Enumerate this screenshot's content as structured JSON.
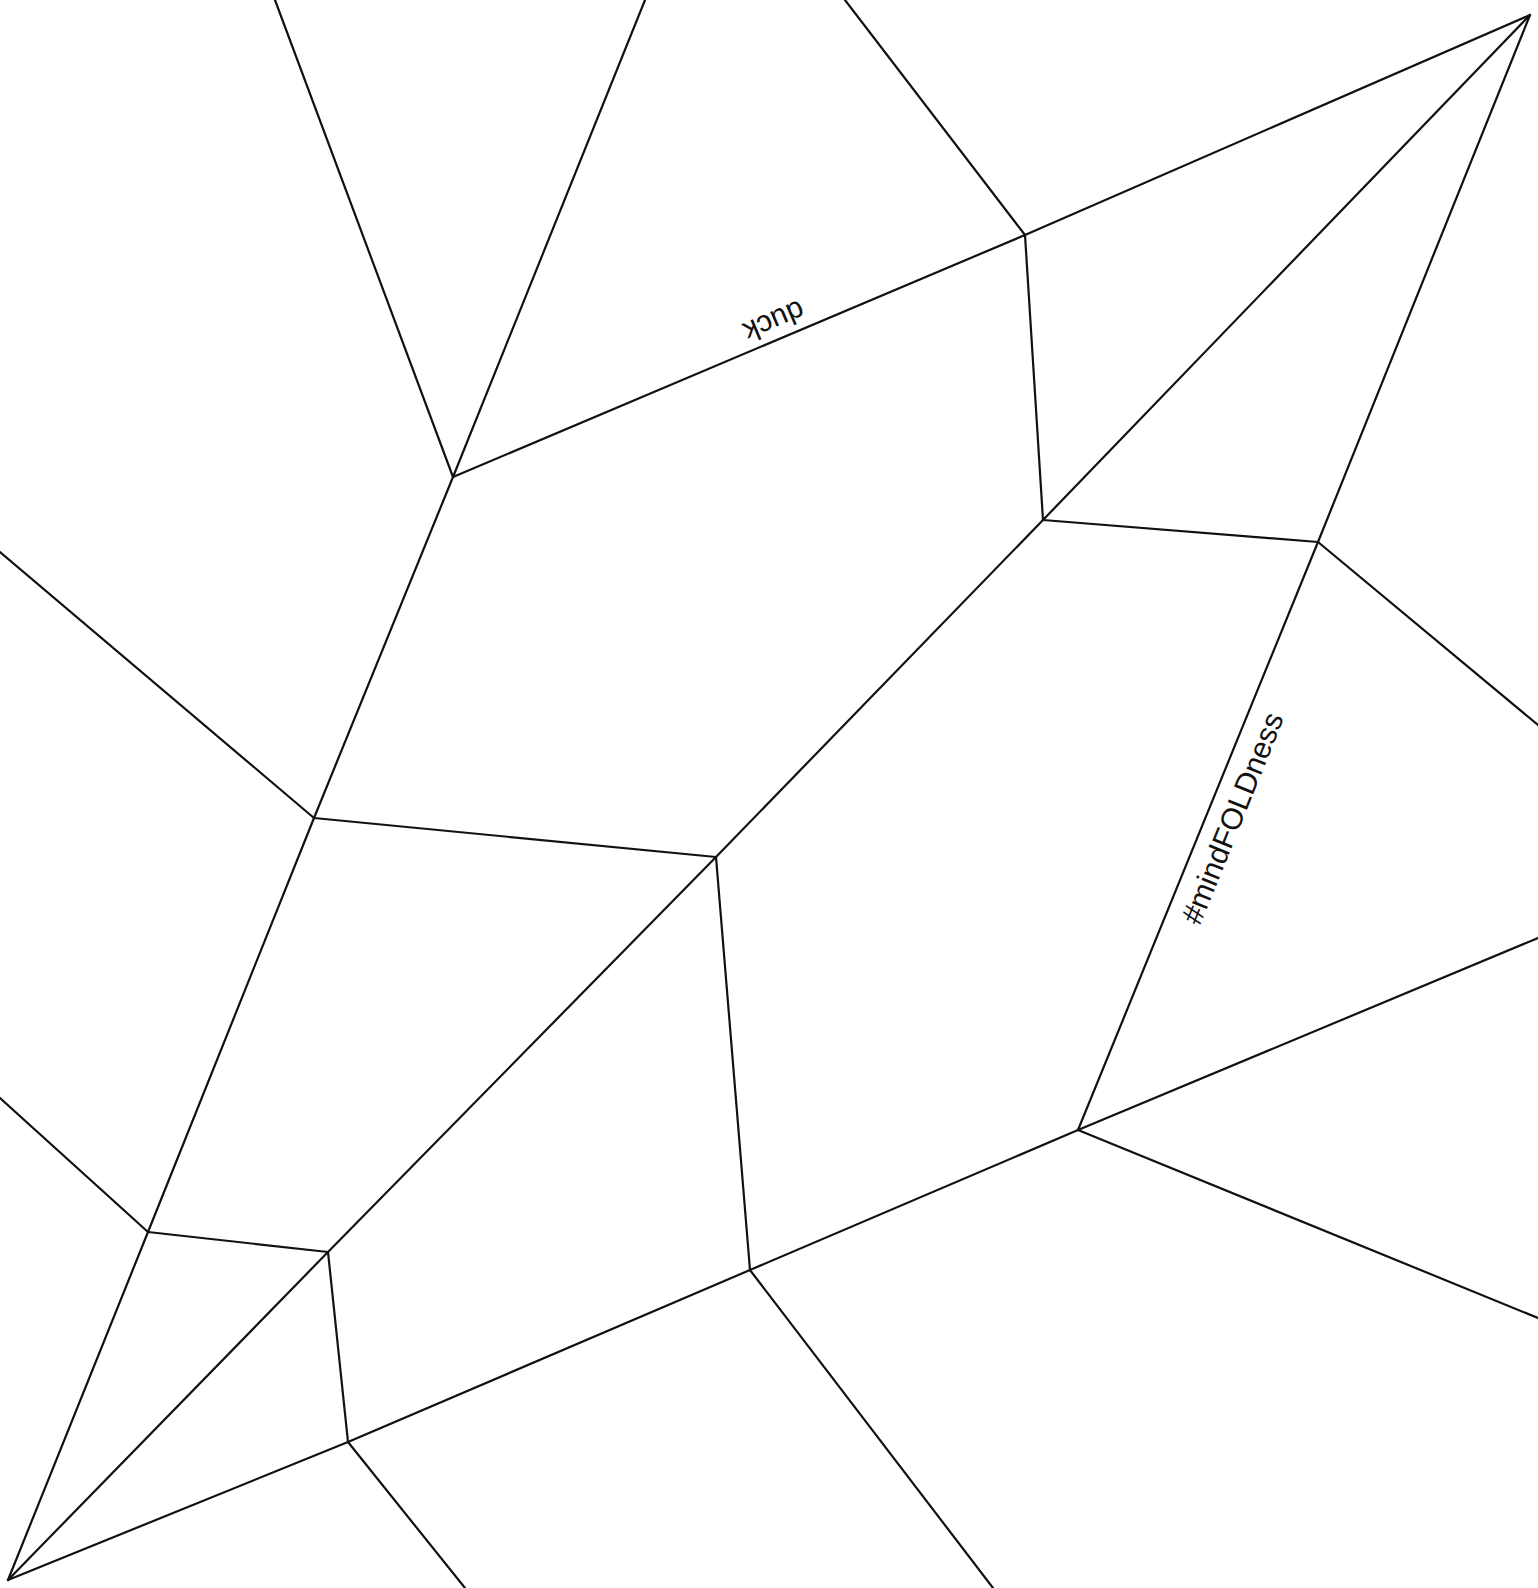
{
  "diagram": {
    "type": "fold pattern",
    "background": "#ffffff",
    "line_color": "#111111",
    "labels": {
      "duck": "duck",
      "hashtag": "#mindFOLDness"
    },
    "lines": [
      [
        [
          275,
          0
        ],
        [
          453,
          477
        ]
      ],
      [
        [
          645,
          0
        ],
        [
          453,
          477
        ]
      ],
      [
        [
          453,
          477
        ],
        [
          1025,
          235
        ]
      ],
      [
        [
          845,
          0
        ],
        [
          1025,
          235
        ]
      ],
      [
        [
          1025,
          235
        ],
        [
          1530,
          15
        ]
      ],
      [
        [
          1025,
          235
        ],
        [
          1043,
          520
        ]
      ],
      [
        [
          1530,
          15
        ],
        [
          1043,
          520
        ]
      ],
      [
        [
          1530,
          15
        ],
        [
          1318,
          542
        ]
      ],
      [
        [
          1043,
          520
        ],
        [
          1318,
          542
        ]
      ],
      [
        [
          1318,
          542
        ],
        [
          1538,
          725
        ]
      ],
      [
        [
          1318,
          542
        ],
        [
          1078,
          1130
        ]
      ],
      [
        [
          0,
          552
        ],
        [
          314,
          818
        ]
      ],
      [
        [
          453,
          477
        ],
        [
          314,
          818
        ]
      ],
      [
        [
          314,
          818
        ],
        [
          716,
          857
        ]
      ],
      [
        [
          1043,
          520
        ],
        [
          716,
          857
        ]
      ],
      [
        [
          716,
          857
        ],
        [
          750,
          1270
        ]
      ],
      [
        [
          314,
          818
        ],
        [
          148,
          1232
        ]
      ],
      [
        [
          0,
          1098
        ],
        [
          148,
          1232
        ]
      ],
      [
        [
          148,
          1232
        ],
        [
          328,
          1252
        ]
      ],
      [
        [
          716,
          857
        ],
        [
          328,
          1252
        ]
      ],
      [
        [
          328,
          1252
        ],
        [
          348,
          1442
        ]
      ],
      [
        [
          148,
          1232
        ],
        [
          8,
          1580
        ]
      ],
      [
        [
          328,
          1252
        ],
        [
          8,
          1580
        ]
      ],
      [
        [
          8,
          1580
        ],
        [
          348,
          1442
        ]
      ],
      [
        [
          348,
          1442
        ],
        [
          750,
          1270
        ]
      ],
      [
        [
          750,
          1270
        ],
        [
          1078,
          1130
        ]
      ],
      [
        [
          1078,
          1130
        ],
        [
          1538,
          938
        ]
      ],
      [
        [
          1078,
          1130
        ],
        [
          1538,
          1318
        ]
      ],
      [
        [
          348,
          1442
        ],
        [
          465,
          1588
        ]
      ],
      [
        [
          750,
          1270
        ],
        [
          993,
          1588
        ]
      ]
    ]
  }
}
